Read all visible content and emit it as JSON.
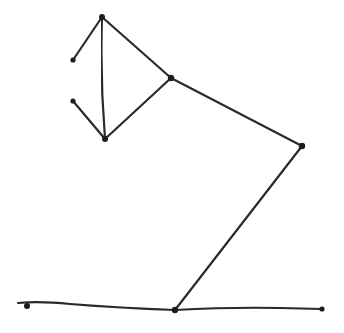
{
  "diagram": {
    "ink_color": "#2a2a2a",
    "background": "#ffffff",
    "nodes": [
      {
        "id": "shade-top",
        "x": 102,
        "y": 17
      },
      {
        "id": "shade-left-upper",
        "x": 73,
        "y": 60
      },
      {
        "id": "shade-left-lower",
        "x": 73,
        "y": 101
      },
      {
        "id": "shade-bottom",
        "x": 105,
        "y": 139
      },
      {
        "id": "head-joint",
        "x": 171,
        "y": 78
      },
      {
        "id": "elbow-joint",
        "x": 302,
        "y": 146
      },
      {
        "id": "base-joint",
        "x": 175,
        "y": 310
      },
      {
        "id": "ground-left",
        "x": 26,
        "y": 305
      },
      {
        "id": "ground-right",
        "x": 322,
        "y": 309
      }
    ],
    "edges": [
      [
        "shade-top",
        "shade-left-upper"
      ],
      [
        "shade-left-upper",
        "shade-left-lower"
      ],
      [
        "shade-left-lower",
        "shade-bottom"
      ],
      [
        "shade-top",
        "shade-bottom"
      ],
      [
        "shade-top",
        "head-joint"
      ],
      [
        "shade-bottom",
        "head-joint"
      ],
      [
        "head-joint",
        "elbow-joint"
      ],
      [
        "elbow-joint",
        "base-joint"
      ]
    ]
  }
}
